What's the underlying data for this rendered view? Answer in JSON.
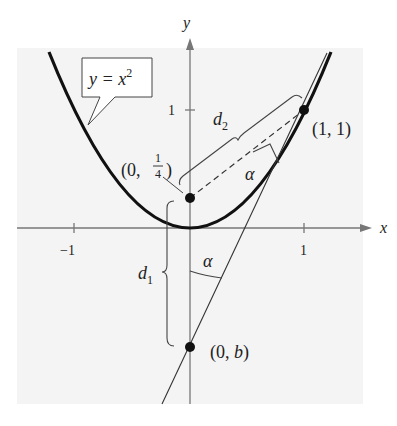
{
  "figure": {
    "axes": {
      "x_label": "x",
      "y_label": "y",
      "x_ticks": [
        {
          "value": -1,
          "label": "−1"
        },
        {
          "value": 1,
          "label": "1"
        }
      ],
      "y_ticks": [
        {
          "value": 1,
          "label": "1"
        }
      ]
    },
    "curve": {
      "equation_label_lhs": "y = x",
      "equation_label_exp": "2"
    },
    "points": {
      "focus": {
        "label_prefix": "(0, ",
        "label_num": "1",
        "label_den": "4",
        "label_suffix": ")"
      },
      "tangent_point": {
        "label": "(1, 1)"
      },
      "y_intercept": {
        "label_prefix": "(0, ",
        "label_var": "b",
        "label_suffix": ")"
      }
    },
    "distances": {
      "d1": {
        "letter": "d",
        "sub": "1"
      },
      "d2": {
        "letter": "d",
        "sub": "2"
      }
    },
    "angles": {
      "alpha_top": "α",
      "alpha_bottom": "α"
    },
    "colors": {
      "background": "#f4f4f4",
      "axis": "#777777",
      "curve": "#111111",
      "line": "#333333"
    }
  }
}
